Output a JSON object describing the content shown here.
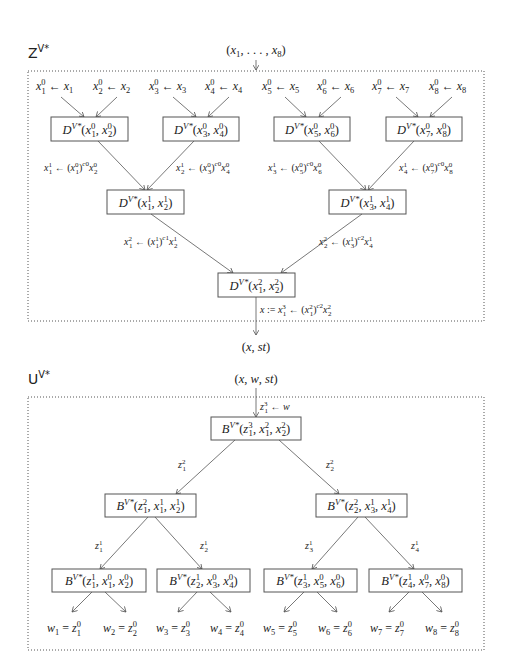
{
  "z_procedure": {
    "title": "Z",
    "title_superscript": "V*",
    "input": "(x1, …, x8)",
    "output": "(x, st)",
    "leaf_assignments": [
      {
        "lhs": "x_1^0",
        "rhs": "x_1"
      },
      {
        "lhs": "x_2^0",
        "rhs": "x_2"
      },
      {
        "lhs": "x_3^0",
        "rhs": "x_3"
      },
      {
        "lhs": "x_4^0",
        "rhs": "x_4"
      },
      {
        "lhs": "x_5^0",
        "rhs": "x_5"
      },
      {
        "lhs": "x_6^0",
        "rhs": "x_6"
      },
      {
        "lhs": "x_7^0",
        "rhs": "x_7"
      },
      {
        "lhs": "x_8^0",
        "rhs": "x_8"
      }
    ],
    "level1_nodes": [
      "D^{V*}(x_1^0, x_2^0)",
      "D^{V*}(x_3^0, x_4^0)",
      "D^{V*}(x_5^0, x_6^0)",
      "D^{V*}(x_7^0, x_8^0)"
    ],
    "level1_edge_labels": [
      "x_1^1 ← (x_1^0)^{c_1^0} x_2^0",
      "x_2^1 ← (x_3^0)^{c_2^0} x_4^0",
      "x_3^1 ← (x_5^0)^{c_3^0} x_6^0",
      "x_4^1 ← (x_7^0)^{c_4^0} x_8^0"
    ],
    "level2_nodes": [
      "D^{V*}(x_1^1, x_2^1)",
      "D^{V*}(x_3^1, x_4^1)"
    ],
    "level2_edge_labels": [
      "x_1^2 ← (x_1^1)^{c_1^1} x_2^1",
      "x_2^2 ← (x_3^1)^{c_2^1} x_4^1"
    ],
    "root_node": "D^{V*}(x_1^2, x_2^2)",
    "root_edge_label": "x := x_1^3 ← (x_1^2)^{c_1^2} x_2^2"
  },
  "u_procedure": {
    "title": "U",
    "title_superscript": "V*",
    "input": "(x, w, st)",
    "input_edge_label": "z_1^3 ← w",
    "root_node": "B^{V*}(z_1^3, x_1^2, x_2^2)",
    "root_edge_labels": [
      "z_1^2",
      "z_2^2"
    ],
    "level2_nodes": [
      "B^{V*}(z_1^2, x_1^1, x_2^1)",
      "B^{V*}(z_2^2, x_3^1, x_4^1)"
    ],
    "level2_edge_labels": [
      "z_1^1",
      "z_2^1",
      "z_3^1",
      "z_4^1"
    ],
    "level3_nodes": [
      "B^{V*}(z_1^1, x_1^0, x_2^0)",
      "B^{V*}(z_2^1, x_3^0, x_4^0)",
      "B^{V*}(z_3^1, x_5^0, x_6^0)",
      "B^{V*}(z_4^1, x_7^0, x_8^0)"
    ],
    "outputs": [
      "w_1 = z_1^0",
      "w_2 = z_2^0",
      "w_3 = z_3^0",
      "w_4 = z_4^0",
      "w_5 = z_5^0",
      "w_6 = z_6^0",
      "w_7 = z_7^0",
      "w_8 = z_8^0"
    ]
  }
}
